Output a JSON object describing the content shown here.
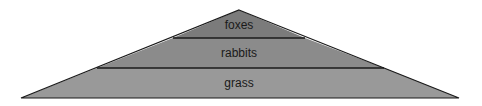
{
  "diagram": {
    "type": "energy-pyramid",
    "levels": [
      {
        "label": "foxes",
        "color": "#7b7b7b"
      },
      {
        "label": "rabbits",
        "color": "#8b8b8b"
      },
      {
        "label": "grass",
        "color": "#999999"
      }
    ],
    "outline_color": "#1a1a1a"
  }
}
